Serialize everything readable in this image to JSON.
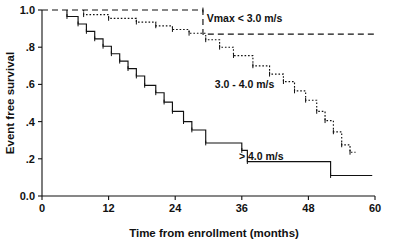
{
  "chart_data": {
    "type": "line",
    "title": "",
    "subtitle": "",
    "xlabel": "Time from enrollment (months)",
    "ylabel": "Event free survival",
    "xlim": [
      0,
      60
    ],
    "ylim": [
      0.0,
      1.0
    ],
    "grid": false,
    "legend_position": "inline-annotations",
    "x_ticks": [
      0,
      12,
      24,
      36,
      48,
      60
    ],
    "x_tick_labels": [
      "0",
      "12",
      "24",
      "36",
      "48",
      "60"
    ],
    "y_ticks": [
      0.0,
      0.2,
      0.4,
      0.6,
      0.8,
      1.0
    ],
    "y_tick_labels": [
      "0.0",
      ".2",
      ".4",
      ".6",
      ".8",
      "1.0"
    ],
    "series": [
      {
        "name": "Vmax < 3.0 m/s",
        "label": "Vmax < 3.0 m/s",
        "style": "dashed",
        "color": "#111111",
        "annotation_x": 36.5,
        "annotation_y": 0.955,
        "points": [
          [
            0.0,
            1.0
          ],
          [
            29.0,
            1.0
          ],
          [
            29.0,
            0.87
          ],
          [
            60.0,
            0.87
          ]
        ]
      },
      {
        "name": "3.0 - 4.0 m/s",
        "label": "3.0 - 4.0 m/s",
        "style": "dotted",
        "color": "#111111",
        "annotation_x": 36.5,
        "annotation_y": 0.6,
        "points": [
          [
            7.5,
            1.0
          ],
          [
            7.5,
            0.975
          ],
          [
            12.0,
            0.975
          ],
          [
            12.0,
            0.955
          ],
          [
            17.0,
            0.955
          ],
          [
            17.0,
            0.935
          ],
          [
            20.5,
            0.935
          ],
          [
            20.5,
            0.915
          ],
          [
            23.5,
            0.915
          ],
          [
            23.5,
            0.895
          ],
          [
            26.5,
            0.895
          ],
          [
            26.5,
            0.875
          ],
          [
            29.5,
            0.875
          ],
          [
            29.5,
            0.84
          ],
          [
            32.0,
            0.84
          ],
          [
            32.0,
            0.8
          ],
          [
            34.5,
            0.8
          ],
          [
            34.5,
            0.755
          ],
          [
            38.0,
            0.755
          ],
          [
            38.0,
            0.7
          ],
          [
            41.0,
            0.7
          ],
          [
            41.0,
            0.655
          ],
          [
            43.5,
            0.655
          ],
          [
            43.5,
            0.615
          ],
          [
            45.5,
            0.615
          ],
          [
            45.5,
            0.565
          ],
          [
            47.5,
            0.565
          ],
          [
            47.5,
            0.515
          ],
          [
            49.5,
            0.515
          ],
          [
            49.5,
            0.455
          ],
          [
            51.0,
            0.455
          ],
          [
            51.0,
            0.405
          ],
          [
            52.5,
            0.405
          ],
          [
            52.5,
            0.345
          ],
          [
            54.0,
            0.345
          ],
          [
            54.0,
            0.275
          ],
          [
            55.5,
            0.275
          ],
          [
            55.5,
            0.235
          ],
          [
            56.5,
            0.235
          ]
        ]
      },
      {
        "name": "> 4.0 m/s",
        "label": "> 4.0 m/s",
        "style": "solid",
        "color": "#111111",
        "annotation_x": 39.5,
        "annotation_y": 0.215,
        "points": [
          [
            4.5,
            1.0
          ],
          [
            4.5,
            0.965
          ],
          [
            6.5,
            0.965
          ],
          [
            6.5,
            0.925
          ],
          [
            8.0,
            0.925
          ],
          [
            8.0,
            0.885
          ],
          [
            9.5,
            0.885
          ],
          [
            9.5,
            0.845
          ],
          [
            11.0,
            0.845
          ],
          [
            11.0,
            0.805
          ],
          [
            12.5,
            0.805
          ],
          [
            12.5,
            0.765
          ],
          [
            14.0,
            0.765
          ],
          [
            14.0,
            0.725
          ],
          [
            15.5,
            0.725
          ],
          [
            15.5,
            0.685
          ],
          [
            17.0,
            0.685
          ],
          [
            17.0,
            0.645
          ],
          [
            18.5,
            0.645
          ],
          [
            18.5,
            0.595
          ],
          [
            20.5,
            0.595
          ],
          [
            20.5,
            0.555
          ],
          [
            22.0,
            0.555
          ],
          [
            22.0,
            0.505
          ],
          [
            23.5,
            0.505
          ],
          [
            23.5,
            0.455
          ],
          [
            25.5,
            0.455
          ],
          [
            25.5,
            0.4
          ],
          [
            27.0,
            0.4
          ],
          [
            27.0,
            0.355
          ],
          [
            29.5,
            0.355
          ],
          [
            29.5,
            0.285
          ],
          [
            36.0,
            0.285
          ],
          [
            36.0,
            0.245
          ],
          [
            37.0,
            0.245
          ],
          [
            37.0,
            0.185
          ],
          [
            52.0,
            0.185
          ],
          [
            52.0,
            0.11
          ],
          [
            59.5,
            0.11
          ]
        ]
      }
    ]
  },
  "axes": {
    "x_title": "Time from enrollment (months)",
    "y_title": "Event free survival"
  }
}
